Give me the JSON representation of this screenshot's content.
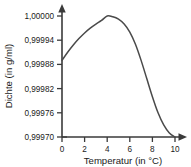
{
  "chart_data": {
    "type": "line",
    "title": "",
    "xlabel": "Temperatur (in °C)",
    "ylabel": "Dichte (in g/ml)",
    "xlim": [
      0,
      10
    ],
    "ylim": [
      0.9997,
      1.0
    ],
    "grid": false,
    "legend": "none",
    "x_ticks": [
      "0",
      "2",
      "4",
      "6",
      "8",
      "10"
    ],
    "x_tick_values": [
      0,
      2,
      4,
      6,
      8,
      10
    ],
    "y_ticks": [
      "0,99970",
      "0,99976",
      "0,99982",
      "0,99988",
      "0,99994",
      "1,00000"
    ],
    "y_tick_values": [
      0.9997,
      0.99976,
      0.99982,
      0.99988,
      0.99994,
      1.0
    ],
    "series": [
      {
        "name": "Dichte von Wasser",
        "color": "#4a4a4a",
        "x": [
          0,
          0.5,
          1,
          1.5,
          2,
          2.5,
          3,
          3.5,
          4,
          4.5,
          5,
          5.5,
          6,
          6.5,
          7,
          7.5,
          8,
          8.5,
          9,
          9.5,
          10
        ],
        "values": [
          0.99989,
          0.99991,
          0.999928,
          0.999944,
          0.999958,
          0.99997,
          0.99998,
          0.999989,
          1.0,
          0.999998,
          0.999992,
          0.99998,
          0.99996,
          0.99993,
          0.99989,
          0.999845,
          0.9998,
          0.99976,
          0.99973,
          0.99971,
          0.9997
        ]
      }
    ]
  },
  "axes": {
    "x_axis_title": "Temperatur (in °C)",
    "y_axis_title": "Dichte (in g/ml)",
    "x_tick_0": "0",
    "x_tick_1": "2",
    "x_tick_2": "4",
    "x_tick_3": "6",
    "x_tick_4": "8",
    "x_tick_5": "10",
    "y_tick_0": "1,00000",
    "y_tick_1": "0,99994",
    "y_tick_2": "0,99988",
    "y_tick_3": "0,99982",
    "y_tick_4": "0,99976",
    "y_tick_5": "0,99970"
  },
  "style": {
    "axis_color": "#3a3a3a",
    "curve_color": "#4a4a4a",
    "text_color": "#1a1a1a",
    "background": "#ffffff"
  }
}
